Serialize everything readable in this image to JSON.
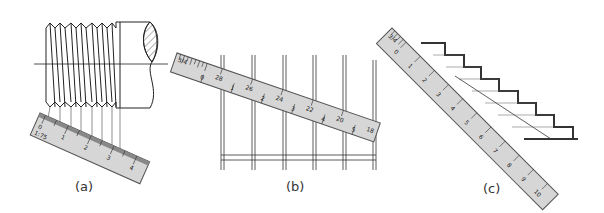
{
  "figure": {
    "panels": [
      {
        "id": "a",
        "caption": "(a)",
        "subject": "threaded bolt",
        "scale_ratio": "1:75",
        "scale_labels": [
          "0",
          "1",
          "2",
          "3",
          "4"
        ]
      },
      {
        "id": "b",
        "caption": "(b)",
        "subject": "equally spaced vertical bars",
        "scale_header": "3/4",
        "scale_labels_major": [
          "0",
          "1",
          "2",
          "3",
          "4",
          "5"
        ],
        "scale_labels_minor": [
          "28",
          "26",
          "24",
          "22",
          "20",
          "18"
        ]
      },
      {
        "id": "c",
        "caption": "(c)",
        "subject": "staircase",
        "scale_header": "3/4",
        "scale_labels": [
          "0",
          "1",
          "2",
          "3",
          "4",
          "5",
          "6",
          "7",
          "8",
          "9",
          "10"
        ]
      }
    ],
    "colors": {
      "line": "#222222",
      "scale_fill": "#d4d4d4",
      "scale_edge": "#555555",
      "background": "#ffffff"
    }
  }
}
